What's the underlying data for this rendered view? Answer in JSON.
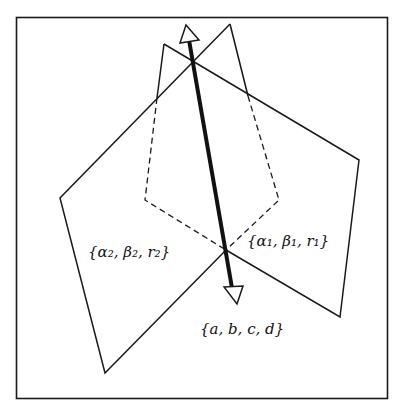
{
  "figure": {
    "type": "geometric-diagram",
    "colors": {
      "stroke": "#1a1a1a",
      "background": "#ffffff"
    }
  },
  "labels": {
    "plane_left": "{α₂, β₂, r₂}",
    "plane_right": "{α₁, β₁, r₁}",
    "line": "{a, b, c, d}"
  }
}
